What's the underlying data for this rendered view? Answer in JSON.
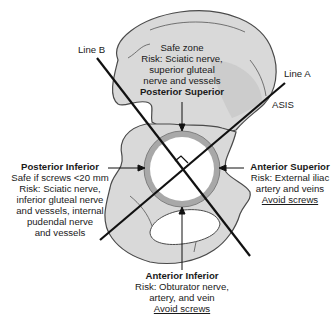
{
  "diagram": {
    "colors": {
      "bone_fill": "#d9d9d9",
      "bone_shade": "#c4c4c4",
      "bone_outline": "#4a4a4a",
      "acetabulum_rim": "#a8a8a8",
      "acetabulum_center": "#ffffff",
      "lines": "#111111",
      "text": "#1a1a1a"
    },
    "lines": {
      "line_a": "Line A",
      "line_b": "Line B",
      "asis": "ASIS"
    },
    "quadrants": {
      "posterior_superior": {
        "title": "Posterior Superior",
        "lines": [
          "Safe zone",
          "Risk: Sciatic nerve,",
          "superior gluteal",
          "nerve and vessels"
        ]
      },
      "posterior_inferior": {
        "title": "Posterior Inferior",
        "lines": [
          "Safe if screws <20 mm",
          "Risk: Sciatic nerve,",
          "inferior gluteal nerve",
          "and vessels, internal",
          "pudendal nerve",
          "and vessels"
        ]
      },
      "anterior_superior": {
        "title": "Anterior Superior",
        "lines": [
          "Risk: External iliac",
          "artery and veins"
        ],
        "warning": "Avoid screws"
      },
      "anterior_inferior": {
        "title": "Anterior Inferior",
        "lines": [
          "Risk: Obturator nerve,",
          "artery, and vein"
        ],
        "warning": "Avoid screws"
      }
    }
  }
}
